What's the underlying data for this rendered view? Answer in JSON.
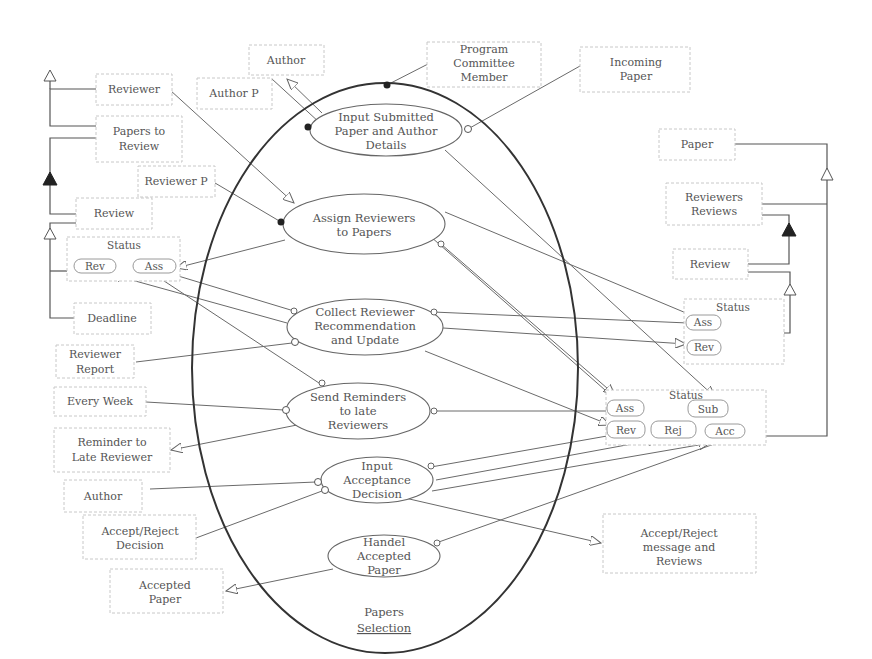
{
  "diagram": {
    "type": "process-flow",
    "container": {
      "label": "Papers Selection"
    },
    "processes": [
      {
        "id": "p1",
        "lines": [
          "Input Submitted",
          "Paper and Author",
          "Details"
        ]
      },
      {
        "id": "p2",
        "lines": [
          "Assign Reviewers",
          "to Papers"
        ]
      },
      {
        "id": "p3",
        "lines": [
          "Collect Reviewer",
          "Recommendation",
          "and Update"
        ]
      },
      {
        "id": "p4",
        "lines": [
          "Send Reminders",
          "to late",
          "Reviewers"
        ]
      },
      {
        "id": "p5",
        "lines": [
          "Input",
          "Acceptance",
          "Decision"
        ]
      },
      {
        "id": "p6",
        "lines": [
          "Handel",
          "Accepted",
          "Paper"
        ]
      }
    ],
    "entities": [
      {
        "id": "author_top",
        "lines": [
          "Author"
        ]
      },
      {
        "id": "author_p",
        "lines": [
          "Author P"
        ]
      },
      {
        "id": "pcm",
        "lines": [
          "Program",
          "Committee",
          "Member"
        ]
      },
      {
        "id": "incoming_paper",
        "lines": [
          "Incoming",
          "Paper"
        ]
      },
      {
        "id": "reviewer",
        "lines": [
          "Reviewer"
        ]
      },
      {
        "id": "papers_to_review",
        "lines": [
          "Papers to",
          "Review"
        ]
      },
      {
        "id": "reviewer_p",
        "lines": [
          "Reviewer P"
        ]
      },
      {
        "id": "review_left",
        "lines": [
          "Review"
        ]
      },
      {
        "id": "deadline",
        "lines": [
          "Deadline"
        ]
      },
      {
        "id": "reviewer_report",
        "lines": [
          "Reviewer",
          "Report"
        ]
      },
      {
        "id": "every_week",
        "lines": [
          "Every Week"
        ]
      },
      {
        "id": "reminder",
        "lines": [
          "Reminder to",
          "Late Reviewer"
        ]
      },
      {
        "id": "author_bottom",
        "lines": [
          "Author"
        ]
      },
      {
        "id": "accept_reject_decision",
        "lines": [
          "Accept/Reject",
          "Decision"
        ]
      },
      {
        "id": "accepted_paper",
        "lines": [
          "Accepted",
          "Paper"
        ]
      },
      {
        "id": "paper_right",
        "lines": [
          "Paper"
        ]
      },
      {
        "id": "reviewers_reviews",
        "lines": [
          "Reviewers",
          "Reviews"
        ]
      },
      {
        "id": "review_right",
        "lines": [
          "Review"
        ]
      },
      {
        "id": "accept_reject_msg",
        "lines": [
          "Accept/Reject",
          "message and",
          "Reviews"
        ]
      }
    ],
    "status_groups": [
      {
        "id": "status_left",
        "title": "Status",
        "states": [
          "Rev",
          "Ass"
        ]
      },
      {
        "id": "status_right",
        "title": "Status",
        "states": [
          "Ass",
          "Rev"
        ]
      },
      {
        "id": "status_paper",
        "title": "Status",
        "states": [
          "Ass",
          "Sub",
          "Rev",
          "Rej",
          "Acc"
        ]
      }
    ]
  }
}
